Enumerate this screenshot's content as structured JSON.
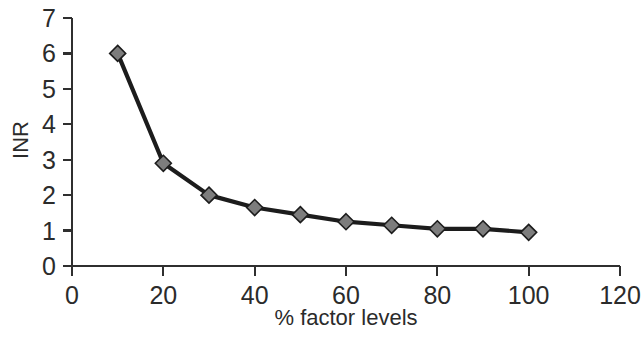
{
  "chart_data": {
    "type": "line",
    "title": "",
    "subtitle": "",
    "xlabel": "% factor levels",
    "ylabel": "INR",
    "xlim": [
      0,
      120
    ],
    "ylim": [
      0,
      7
    ],
    "x_ticks": [
      0,
      20,
      40,
      60,
      80,
      100,
      120
    ],
    "x_tick_labels": [
      "0",
      "20",
      "40",
      "60",
      "80",
      "100",
      "120"
    ],
    "y_ticks": [
      0,
      1,
      2,
      3,
      4,
      5,
      6,
      7
    ],
    "y_tick_labels": [
      "0",
      "1",
      "2",
      "3",
      "4",
      "5",
      "6",
      "7"
    ],
    "grid": false,
    "legend": false,
    "legend_position": "none",
    "marker": "diamond",
    "marker_color": "#7d7d7d",
    "marker_edge_color": "#1c1c1c",
    "line_color": "#1c1c1c",
    "background_color": "#ffffff",
    "x": [
      10,
      20,
      30,
      40,
      50,
      60,
      70,
      80,
      90,
      100
    ],
    "values": [
      6.0,
      2.9,
      2.0,
      1.65,
      1.45,
      1.25,
      1.15,
      1.05,
      1.05,
      0.95
    ],
    "series": [
      {
        "name": "INR",
        "x": [
          10,
          20,
          30,
          40,
          50,
          60,
          70,
          80,
          90,
          100
        ],
        "values": [
          6.0,
          2.9,
          2.0,
          1.65,
          1.45,
          1.25,
          1.15,
          1.05,
          1.05,
          0.95
        ]
      }
    ],
    "annotations": []
  },
  "axes": {
    "y_title": "INR",
    "x_title": "% factor levels"
  }
}
